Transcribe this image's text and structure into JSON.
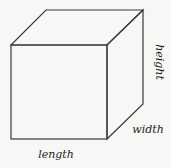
{
  "diagram": {
    "type": "cube",
    "stroke_color": "#3a3a3a",
    "background": "#f7f7f5",
    "labels": {
      "length": "length",
      "width": "width",
      "height": "height"
    }
  }
}
